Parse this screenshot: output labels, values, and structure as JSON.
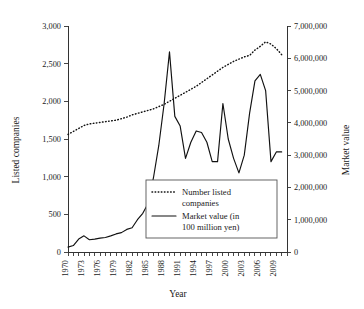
{
  "chart_data": {
    "type": "line",
    "title": "",
    "xlabel": "Year",
    "ylabel": "Listed companies",
    "ylabel_right": "Market value",
    "xlim": [
      1970,
      2011
    ],
    "ylim": [
      0,
      3000
    ],
    "ylim_right": [
      0,
      7000000
    ],
    "grid": false,
    "legend_position": "center",
    "y_ticks": [
      "0",
      "500",
      "1,000",
      "1,500",
      "2,000",
      "2,500",
      "3,000"
    ],
    "y_tick_values": [
      0,
      500,
      1000,
      1500,
      2000,
      2500,
      3000
    ],
    "y_ticks_right": [
      "0",
      "1,000,000",
      "2,000,000",
      "3,000,000",
      "4,000,000",
      "5,000,000",
      "6,000,000",
      "7,000,000"
    ],
    "y_tick_values_right": [
      0,
      1000000,
      2000000,
      3000000,
      4000000,
      5000000,
      6000000,
      7000000
    ],
    "x_ticks": [
      "1970",
      "1973",
      "1976",
      "1979",
      "1982",
      "1985",
      "1988",
      "1991",
      "1994",
      "1997",
      "2000",
      "2003",
      "2006",
      "2009"
    ],
    "x_tick_values": [
      1970,
      1973,
      1976,
      1979,
      1982,
      1985,
      1988,
      1991,
      1994,
      1997,
      2000,
      2003,
      2006,
      2009
    ],
    "x": [
      1970,
      1971,
      1972,
      1973,
      1974,
      1975,
      1976,
      1977,
      1978,
      1979,
      1980,
      1981,
      1982,
      1983,
      1984,
      1985,
      1986,
      1987,
      1988,
      1989,
      1990,
      1991,
      1992,
      1993,
      1994,
      1995,
      1996,
      1997,
      1998,
      1999,
      2000,
      2001,
      2002,
      2003,
      2004,
      2005,
      2006,
      2007,
      2008,
      2009,
      2010
    ],
    "series": [
      {
        "name": "Number listed companies",
        "axis": "left",
        "style": "dotted",
        "unit": "companies",
        "values": [
          1560,
          1600,
          1640,
          1680,
          1700,
          1710,
          1720,
          1730,
          1740,
          1750,
          1770,
          1790,
          1820,
          1840,
          1860,
          1880,
          1900,
          1930,
          1960,
          2000,
          2040,
          2080,
          2120,
          2160,
          2200,
          2250,
          2300,
          2350,
          2400,
          2450,
          2490,
          2530,
          2560,
          2590,
          2610,
          2680,
          2730,
          2790,
          2760,
          2700,
          2620
        ]
      },
      {
        "name": "Market value (in 100 million yen)",
        "axis": "right",
        "style": "solid",
        "unit": "100 million yen",
        "values": [
          150000,
          200000,
          400000,
          500000,
          380000,
          400000,
          430000,
          450000,
          500000,
          560000,
          600000,
          700000,
          750000,
          1000000,
          1200000,
          1500000,
          2300000,
          3300000,
          4600000,
          6200000,
          4200000,
          3900000,
          2900000,
          3400000,
          3750000,
          3700000,
          3400000,
          2800000,
          2800000,
          4600000,
          3500000,
          2900000,
          2450000,
          3000000,
          4300000,
          5300000,
          5500000,
          5000000,
          2800000,
          3100000,
          3100000
        ]
      }
    ],
    "annotations": []
  },
  "legend": {
    "entries": [
      {
        "label_line1": "Number listed",
        "label_line2": "companies",
        "style": "dotted"
      },
      {
        "label_line1": "Market value (in",
        "label_line2": "100 million yen)",
        "style": "solid"
      }
    ]
  },
  "colors": {
    "series": "#111111",
    "axis": "#333333",
    "background": "#ffffff",
    "text": "#1a1a1a"
  }
}
